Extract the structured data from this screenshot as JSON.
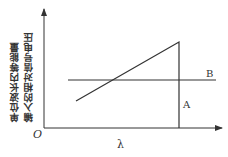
{
  "diagram": {
    "y_axis_label_lines": [
      "单位波长内等能量",
      "输入的相对信号电压"
    ],
    "x_axis_label": "λ",
    "origin_label": "O",
    "curves": [
      {
        "id": "A",
        "label": "A",
        "description": "rising diagonal line then vertical drop to x-axis"
      },
      {
        "id": "B",
        "label": "B",
        "description": "horizontal flat line"
      }
    ]
  },
  "colors": {
    "stroke": "#333333",
    "background": "#ffffff"
  }
}
